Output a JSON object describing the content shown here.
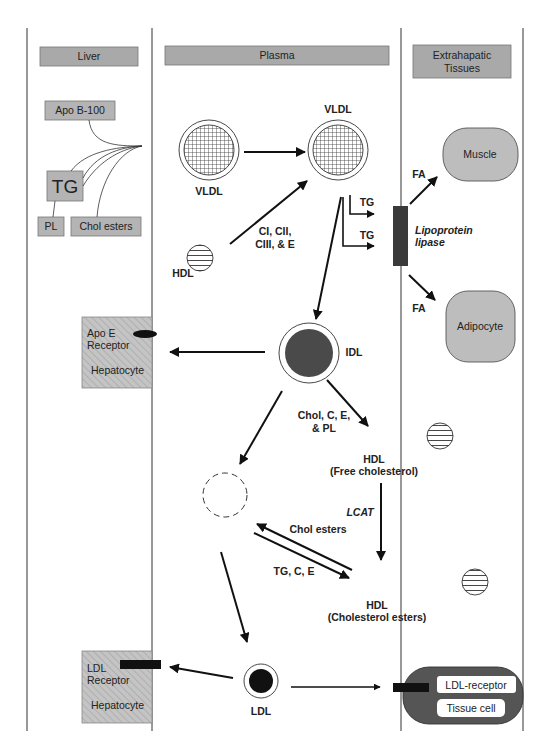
{
  "columns": [
    {
      "id": "liver",
      "header": "Liver"
    },
    {
      "id": "plasma",
      "header": "Plasma"
    },
    {
      "id": "extrahepatic",
      "header_line1": "Extrahapatic",
      "header_line2": "Tissues"
    }
  ],
  "liver": {
    "apo_b100": "Apo B-100",
    "tg": "TG",
    "pl": "PL",
    "chol_esters": "Chol esters",
    "apoe_hepatocyte": {
      "line1": "Apo E",
      "line2": "Receptor",
      "cell": "Hepatocyte"
    },
    "ldl_hepatocyte": {
      "line1": "LDL",
      "line2": "Receptor",
      "cell": "Hepatocyte"
    }
  },
  "plasma": {
    "vldl_nascent": "VLDL",
    "vldl_mature": "VLDL",
    "hdl_donor": "HDL",
    "apo_transfer": {
      "line1": "CI, CII,",
      "line2": "CIII, & E"
    },
    "tg_1": "TG",
    "tg_2": "TG",
    "idl": "IDL",
    "idl_transfer": {
      "line1": "Chol, C, E,",
      "line2": "& PL"
    },
    "hdl_free": {
      "name": "HDL",
      "note": "(Free cholesterol)"
    },
    "lcat": "LCAT",
    "chol_esters_transfer": "Chol esters",
    "tg_c_e_transfer": "TG, C, E",
    "hdl_esters": {
      "name": "HDL",
      "note": "(Cholesterol esters)"
    },
    "ldl": "LDL"
  },
  "extrahepatic": {
    "lipoprotein_lipase": {
      "line1": "Lipoprotein",
      "line2": "lipase"
    },
    "fa_1": "FA",
    "fa_2": "FA",
    "muscle": "Muscle",
    "adipocyte": "Adipocyte",
    "ldl_receptor": "LDL-receptor",
    "tissue_cell": "Tissue cell"
  },
  "colors": {
    "header_fill": "#a9a9a9",
    "box_fill": "#b4b4b4",
    "tissue_fill": "#bdbdbd",
    "idl_fill": "#4a4a4a",
    "ldl_fill": "#111111",
    "lipase_fill": "#3a3a3a",
    "tissue_cell_fill": "#555555"
  }
}
